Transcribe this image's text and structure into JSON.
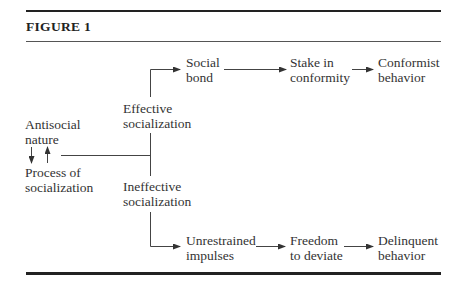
{
  "figure": {
    "title": "FIGURE 1"
  },
  "nodes": {
    "antisocial_nature": [
      "Antisocial",
      "nature"
    ],
    "process_of_socialization": [
      "Process of",
      "socialization"
    ],
    "effective_socialization": [
      "Effective",
      "socialization"
    ],
    "ineffective_socialization": [
      "Ineffective",
      "socialization"
    ],
    "social_bond": [
      "Social",
      "bond"
    ],
    "stake_in_conformity": [
      "Stake in",
      "conformity"
    ],
    "conformist_behavior": [
      "Conformist",
      "behavior"
    ],
    "unrestrained_impulses": [
      "Unrestrained",
      "impulses"
    ],
    "freedom_to_deviate": [
      "Freedom",
      "to deviate"
    ],
    "delinquent_behavior": [
      "Delinquent",
      "behavior"
    ]
  },
  "edges": [
    {
      "from": "antisocial_nature",
      "to": "process_of_socialization",
      "type": "bidirectional"
    },
    {
      "from": "process_of_socialization",
      "to": "effective_socialization"
    },
    {
      "from": "process_of_socialization",
      "to": "ineffective_socialization"
    },
    {
      "from": "effective_socialization",
      "to": "social_bond"
    },
    {
      "from": "social_bond",
      "to": "stake_in_conformity"
    },
    {
      "from": "stake_in_conformity",
      "to": "conformist_behavior"
    },
    {
      "from": "ineffective_socialization",
      "to": "unrestrained_impulses"
    },
    {
      "from": "unrestrained_impulses",
      "to": "freedom_to_deviate"
    },
    {
      "from": "freedom_to_deviate",
      "to": "delinquent_behavior"
    }
  ]
}
